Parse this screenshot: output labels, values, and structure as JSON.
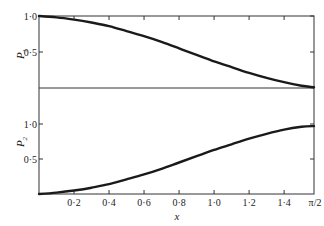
{
  "chart_data": [
    {
      "type": "line",
      "panel": "top",
      "ylabel": "P",
      "ylabel_sub": "1",
      "xlabel": "x",
      "xlim": [
        0,
        1.5708
      ],
      "ylim": [
        0,
        1.0
      ],
      "yticks": [
        {
          "value": 0.5,
          "label": "0·5"
        },
        {
          "value": 1.0,
          "label": "1·0"
        }
      ],
      "grid": false,
      "series": [
        {
          "name": "P1",
          "x": [
            0,
            0.1,
            0.2,
            0.3,
            0.4,
            0.5,
            0.6,
            0.7,
            0.8,
            0.9,
            1.0,
            1.1,
            1.2,
            1.3,
            1.4,
            1.5,
            1.5708
          ],
          "values": [
            1.0,
            0.98,
            0.95,
            0.91,
            0.86,
            0.79,
            0.72,
            0.64,
            0.55,
            0.46,
            0.37,
            0.29,
            0.21,
            0.14,
            0.08,
            0.03,
            0.01
          ]
        }
      ]
    },
    {
      "type": "line",
      "panel": "bottom",
      "ylabel": "P",
      "ylabel_sub": "2",
      "xlabel": "x",
      "xlim": [
        0,
        1.5708
      ],
      "ylim": [
        0,
        1.0
      ],
      "yticks": [
        {
          "value": 0.5,
          "label": "0·5"
        },
        {
          "value": 1.0,
          "label": "1·0"
        }
      ],
      "xticks": [
        {
          "value": 0.2,
          "label": "0·2"
        },
        {
          "value": 0.4,
          "label": "0·4"
        },
        {
          "value": 0.6,
          "label": "0·6"
        },
        {
          "value": 0.8,
          "label": "0·8"
        },
        {
          "value": 1.0,
          "label": "1·0"
        },
        {
          "value": 1.2,
          "label": "1·2"
        },
        {
          "value": 1.4,
          "label": "1·4"
        },
        {
          "value": 1.5708,
          "label": "π/2"
        }
      ],
      "grid": false,
      "series": [
        {
          "name": "P2",
          "x": [
            0,
            0.1,
            0.2,
            0.3,
            0.4,
            0.5,
            0.6,
            0.7,
            0.8,
            0.9,
            1.0,
            1.1,
            1.2,
            1.3,
            1.4,
            1.5,
            1.5708
          ],
          "values": [
            0.0,
            0.02,
            0.05,
            0.09,
            0.14,
            0.21,
            0.28,
            0.36,
            0.45,
            0.54,
            0.63,
            0.71,
            0.79,
            0.86,
            0.92,
            0.96,
            0.97
          ]
        }
      ]
    }
  ],
  "labels": {
    "top_ylabel": "P",
    "top_ylabel_sub": "1",
    "bottom_ylabel": "P",
    "bottom_ylabel_sub": "2",
    "xlabel": "x",
    "top_ytick_1": "1·0",
    "top_ytick_05": "0·5",
    "bottom_ytick_1": "1·0",
    "bottom_ytick_05": "0·5"
  }
}
